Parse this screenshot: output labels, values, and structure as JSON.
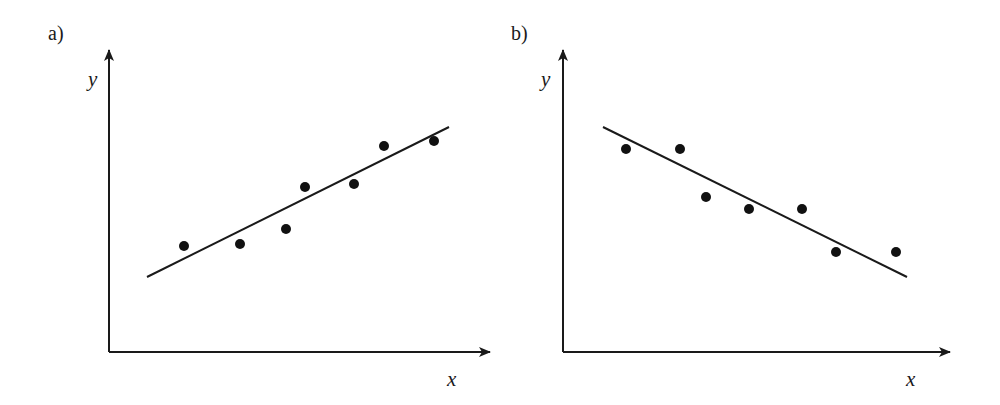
{
  "colors": {
    "ink": "#1a1a1a",
    "points": "#111111",
    "background": "#ffffff"
  },
  "chart_data": [
    {
      "type": "scatter",
      "panel_label": "a)",
      "title": "",
      "xlabel": "x",
      "ylabel": "y",
      "trend": "positive",
      "ticks": "none",
      "grid": false,
      "legend": "none",
      "points_px": [
        [
          184,
          246
        ],
        [
          240,
          244
        ],
        [
          286,
          229
        ],
        [
          305,
          187
        ],
        [
          354,
          184
        ],
        [
          384,
          146
        ],
        [
          434,
          141
        ]
      ],
      "points_relative": [
        {
          "x": 0.2,
          "y": 0.35
        },
        {
          "x": 0.34,
          "y": 0.36
        },
        {
          "x": 0.46,
          "y": 0.41
        },
        {
          "x": 0.51,
          "y": 0.55
        },
        {
          "x": 0.64,
          "y": 0.56
        },
        {
          "x": 0.72,
          "y": 0.68
        },
        {
          "x": 0.85,
          "y": 0.7
        }
      ],
      "fit_line_px": [
        [
          147,
          277
        ],
        [
          449,
          127
        ]
      ],
      "axes_px": {
        "origin": [
          109,
          352
        ],
        "y_top": [
          109,
          48
        ],
        "x_right": [
          492,
          352
        ]
      },
      "label_px": {
        "panel": [
          48,
          40
        ],
        "y": [
          88,
          86
        ],
        "x": [
          447,
          386
        ]
      }
    },
    {
      "type": "scatter",
      "panel_label": "b)",
      "title": "",
      "xlabel": "x",
      "ylabel": "y",
      "trend": "negative",
      "ticks": "none",
      "grid": false,
      "legend": "none",
      "points_px": [
        [
          626,
          149
        ],
        [
          680,
          149
        ],
        [
          706,
          197
        ],
        [
          749,
          209
        ],
        [
          802,
          209
        ],
        [
          836,
          252
        ],
        [
          896,
          252
        ]
      ],
      "points_relative": [
        {
          "x": 0.16,
          "y": 0.67
        },
        {
          "x": 0.3,
          "y": 0.67
        },
        {
          "x": 0.37,
          "y": 0.51
        },
        {
          "x": 0.48,
          "y": 0.47
        },
        {
          "x": 0.62,
          "y": 0.47
        },
        {
          "x": 0.71,
          "y": 0.33
        },
        {
          "x": 0.86,
          "y": 0.33
        }
      ],
      "fit_line_px": [
        [
          603,
          127
        ],
        [
          907,
          277
        ]
      ],
      "axes_px": {
        "origin": [
          563,
          352
        ],
        "y_top": [
          563,
          48
        ],
        "x_right": [
          952,
          352
        ]
      },
      "label_px": {
        "panel": [
          511,
          40
        ],
        "y": [
          541,
          86
        ],
        "x": [
          906,
          386
        ]
      }
    }
  ]
}
